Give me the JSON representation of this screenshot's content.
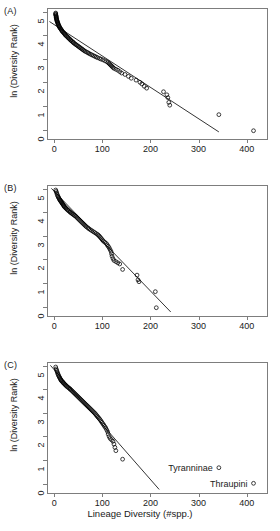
{
  "figure": {
    "xaxis_title": "Lineage Diversity (#spp.)",
    "yaxis_title": "ln (Diversity Rank)"
  },
  "panels": [
    {
      "tag": "(A)"
    },
    {
      "tag": "(B)"
    },
    {
      "tag": "(C)"
    }
  ],
  "axis": {
    "xticks": [
      "0",
      "100",
      "200",
      "300",
      "400"
    ],
    "yticks": [
      "0",
      "1",
      "2",
      "3",
      "4",
      "5"
    ]
  },
  "annotations": {
    "tyranninae": "Tyranninae",
    "thraupini": "Thraupini"
  },
  "colors": {
    "point": "#000000",
    "line": "#000000",
    "axis": "#7d7d7d",
    "background": "#ffffff"
  },
  "chart_data": {
    "type": "scatter",
    "title": "",
    "xlabel": "Lineage Diversity (#spp.)",
    "ylabel": "ln (Diversity Rank)",
    "xlim": [
      -15,
      440
    ],
    "ylim": [
      -0.35,
      5.15
    ],
    "grid": false,
    "legend": null,
    "panels": [
      {
        "tag": "(A)",
        "fit_line": {
          "x": [
            -12,
            340
          ],
          "y": [
            4.62,
            -0.05
          ]
        },
        "points": [
          {
            "x": 1,
            "y": 4.98
          },
          {
            "x": 1,
            "y": 4.95
          },
          {
            "x": 1,
            "y": 4.92
          },
          {
            "x": 1,
            "y": 4.89
          },
          {
            "x": 2,
            "y": 4.86
          },
          {
            "x": 2,
            "y": 4.83
          },
          {
            "x": 2,
            "y": 4.8
          },
          {
            "x": 2,
            "y": 4.77
          },
          {
            "x": 3,
            "y": 4.74
          },
          {
            "x": 3,
            "y": 4.71
          },
          {
            "x": 3,
            "y": 4.68
          },
          {
            "x": 4,
            "y": 4.65
          },
          {
            "x": 4,
            "y": 4.62
          },
          {
            "x": 5,
            "y": 4.59
          },
          {
            "x": 5,
            "y": 4.56
          },
          {
            "x": 6,
            "y": 4.53
          },
          {
            "x": 6,
            "y": 4.5
          },
          {
            "x": 7,
            "y": 4.47
          },
          {
            "x": 8,
            "y": 4.44
          },
          {
            "x": 8,
            "y": 4.41
          },
          {
            "x": 9,
            "y": 4.38
          },
          {
            "x": 10,
            "y": 4.35
          },
          {
            "x": 11,
            "y": 4.32
          },
          {
            "x": 12,
            "y": 4.29
          },
          {
            "x": 13,
            "y": 4.26
          },
          {
            "x": 14,
            "y": 4.23
          },
          {
            "x": 15,
            "y": 4.2
          },
          {
            "x": 16,
            "y": 4.17
          },
          {
            "x": 18,
            "y": 4.14
          },
          {
            "x": 19,
            "y": 4.11
          },
          {
            "x": 20,
            "y": 4.08
          },
          {
            "x": 21,
            "y": 4.05
          },
          {
            "x": 23,
            "y": 4.02
          },
          {
            "x": 24,
            "y": 3.99
          },
          {
            "x": 26,
            "y": 3.96
          },
          {
            "x": 27,
            "y": 3.93
          },
          {
            "x": 29,
            "y": 3.9
          },
          {
            "x": 30,
            "y": 3.87
          },
          {
            "x": 32,
            "y": 3.84
          },
          {
            "x": 33,
            "y": 3.81
          },
          {
            "x": 35,
            "y": 3.78
          },
          {
            "x": 37,
            "y": 3.75
          },
          {
            "x": 38,
            "y": 3.72
          },
          {
            "x": 40,
            "y": 3.69
          },
          {
            "x": 42,
            "y": 3.66
          },
          {
            "x": 44,
            "y": 3.63
          },
          {
            "x": 46,
            "y": 3.6
          },
          {
            "x": 48,
            "y": 3.57
          },
          {
            "x": 50,
            "y": 3.54
          },
          {
            "x": 52,
            "y": 3.51
          },
          {
            "x": 54,
            "y": 3.48
          },
          {
            "x": 56,
            "y": 3.45
          },
          {
            "x": 58,
            "y": 3.42
          },
          {
            "x": 60,
            "y": 3.39
          },
          {
            "x": 62,
            "y": 3.36
          },
          {
            "x": 65,
            "y": 3.33
          },
          {
            "x": 68,
            "y": 3.3
          },
          {
            "x": 70,
            "y": 3.27
          },
          {
            "x": 73,
            "y": 3.24
          },
          {
            "x": 76,
            "y": 3.21
          },
          {
            "x": 79,
            "y": 3.18
          },
          {
            "x": 82,
            "y": 3.15
          },
          {
            "x": 85,
            "y": 3.12
          },
          {
            "x": 88,
            "y": 3.09
          },
          {
            "x": 92,
            "y": 3.06
          },
          {
            "x": 95,
            "y": 3.03
          },
          {
            "x": 99,
            "y": 3.0
          },
          {
            "x": 103,
            "y": 2.96
          },
          {
            "x": 107,
            "y": 2.92
          },
          {
            "x": 110,
            "y": 2.88
          },
          {
            "x": 112,
            "y": 2.84
          },
          {
            "x": 114,
            "y": 2.8
          },
          {
            "x": 116,
            "y": 2.76
          },
          {
            "x": 118,
            "y": 2.72
          },
          {
            "x": 120,
            "y": 2.68
          },
          {
            "x": 122,
            "y": 2.64
          },
          {
            "x": 126,
            "y": 2.6
          },
          {
            "x": 130,
            "y": 2.56
          },
          {
            "x": 134,
            "y": 2.5
          },
          {
            "x": 138,
            "y": 2.44
          },
          {
            "x": 145,
            "y": 2.38
          },
          {
            "x": 152,
            "y": 2.3
          },
          {
            "x": 158,
            "y": 2.22
          },
          {
            "x": 168,
            "y": 2.14
          },
          {
            "x": 176,
            "y": 2.05
          },
          {
            "x": 180,
            "y": 1.98
          },
          {
            "x": 185,
            "y": 1.88
          },
          {
            "x": 190,
            "y": 1.8
          },
          {
            "x": 225,
            "y": 1.65
          },
          {
            "x": 232,
            "y": 1.52
          },
          {
            "x": 234,
            "y": 1.4
          },
          {
            "x": 236,
            "y": 1.2
          },
          {
            "x": 238,
            "y": 1.08
          },
          {
            "x": 340,
            "y": 0.68
          },
          {
            "x": 412,
            "y": 0.0
          }
        ]
      },
      {
        "tag": "(B)",
        "fit_line": {
          "x": [
            -8,
            240
          ],
          "y": [
            5.05,
            -0.18
          ]
        },
        "points": [
          {
            "x": 1,
            "y": 4.98
          },
          {
            "x": 2,
            "y": 4.92
          },
          {
            "x": 3,
            "y": 4.86
          },
          {
            "x": 4,
            "y": 4.8
          },
          {
            "x": 5,
            "y": 4.74
          },
          {
            "x": 6,
            "y": 4.7
          },
          {
            "x": 7,
            "y": 4.66
          },
          {
            "x": 8,
            "y": 4.62
          },
          {
            "x": 9,
            "y": 4.58
          },
          {
            "x": 10,
            "y": 4.55
          },
          {
            "x": 11,
            "y": 4.52
          },
          {
            "x": 12,
            "y": 4.49
          },
          {
            "x": 13,
            "y": 4.46
          },
          {
            "x": 14,
            "y": 4.43
          },
          {
            "x": 15,
            "y": 4.4
          },
          {
            "x": 16,
            "y": 4.37
          },
          {
            "x": 17,
            "y": 4.34
          },
          {
            "x": 18,
            "y": 4.31
          },
          {
            "x": 19,
            "y": 4.28
          },
          {
            "x": 20,
            "y": 4.25
          },
          {
            "x": 22,
            "y": 4.22
          },
          {
            "x": 23,
            "y": 4.19
          },
          {
            "x": 25,
            "y": 4.16
          },
          {
            "x": 26,
            "y": 4.13
          },
          {
            "x": 28,
            "y": 4.1
          },
          {
            "x": 30,
            "y": 4.07
          },
          {
            "x": 31,
            "y": 4.04
          },
          {
            "x": 33,
            "y": 4.01
          },
          {
            "x": 35,
            "y": 3.98
          },
          {
            "x": 37,
            "y": 3.95
          },
          {
            "x": 39,
            "y": 3.92
          },
          {
            "x": 41,
            "y": 3.89
          },
          {
            "x": 43,
            "y": 3.86
          },
          {
            "x": 45,
            "y": 3.82
          },
          {
            "x": 47,
            "y": 3.78
          },
          {
            "x": 49,
            "y": 3.74
          },
          {
            "x": 51,
            "y": 3.7
          },
          {
            "x": 53,
            "y": 3.66
          },
          {
            "x": 55,
            "y": 3.62
          },
          {
            "x": 57,
            "y": 3.58
          },
          {
            "x": 59,
            "y": 3.54
          },
          {
            "x": 61,
            "y": 3.5
          },
          {
            "x": 63,
            "y": 3.46
          },
          {
            "x": 65,
            "y": 3.42
          },
          {
            "x": 68,
            "y": 3.38
          },
          {
            "x": 70,
            "y": 3.34
          },
          {
            "x": 73,
            "y": 3.3
          },
          {
            "x": 76,
            "y": 3.26
          },
          {
            "x": 79,
            "y": 3.22
          },
          {
            "x": 82,
            "y": 3.18
          },
          {
            "x": 85,
            "y": 3.14
          },
          {
            "x": 88,
            "y": 3.1
          },
          {
            "x": 90,
            "y": 3.06
          },
          {
            "x": 92,
            "y": 3.02
          },
          {
            "x": 94,
            "y": 2.97
          },
          {
            "x": 96,
            "y": 2.92
          },
          {
            "x": 98,
            "y": 2.87
          },
          {
            "x": 100,
            "y": 2.82
          },
          {
            "x": 103,
            "y": 2.77
          },
          {
            "x": 106,
            "y": 2.72
          },
          {
            "x": 108,
            "y": 2.66
          },
          {
            "x": 110,
            "y": 2.6
          },
          {
            "x": 112,
            "y": 2.54
          },
          {
            "x": 114,
            "y": 2.46
          },
          {
            "x": 116,
            "y": 2.38
          },
          {
            "x": 117,
            "y": 2.28
          },
          {
            "x": 118,
            "y": 2.18
          },
          {
            "x": 120,
            "y": 2.08
          },
          {
            "x": 122,
            "y": 2.0
          },
          {
            "x": 126,
            "y": 1.95
          },
          {
            "x": 130,
            "y": 1.9
          },
          {
            "x": 134,
            "y": 1.85
          },
          {
            "x": 140,
            "y": 1.62
          },
          {
            "x": 170,
            "y": 1.38
          },
          {
            "x": 172,
            "y": 1.18
          },
          {
            "x": 174,
            "y": 1.1
          },
          {
            "x": 208,
            "y": 0.68
          },
          {
            "x": 210,
            "y": 0.0
          }
        ]
      },
      {
        "tag": "(C)",
        "fit_line": {
          "x": [
            -10,
            216
          ],
          "y": [
            5.05,
            -0.2
          ]
        },
        "points": [
          {
            "x": 1,
            "y": 4.98
          },
          {
            "x": 2,
            "y": 4.9
          },
          {
            "x": 3,
            "y": 4.84
          },
          {
            "x": 4,
            "y": 4.78
          },
          {
            "x": 5,
            "y": 4.72
          },
          {
            "x": 6,
            "y": 4.67
          },
          {
            "x": 7,
            "y": 4.62
          },
          {
            "x": 8,
            "y": 4.58
          },
          {
            "x": 9,
            "y": 4.54
          },
          {
            "x": 10,
            "y": 4.5
          },
          {
            "x": 11,
            "y": 4.46
          },
          {
            "x": 12,
            "y": 4.43
          },
          {
            "x": 13,
            "y": 4.4
          },
          {
            "x": 14,
            "y": 4.37
          },
          {
            "x": 16,
            "y": 4.34
          },
          {
            "x": 17,
            "y": 4.31
          },
          {
            "x": 18,
            "y": 4.28
          },
          {
            "x": 20,
            "y": 4.25
          },
          {
            "x": 21,
            "y": 4.22
          },
          {
            "x": 23,
            "y": 4.19
          },
          {
            "x": 24,
            "y": 4.16
          },
          {
            "x": 26,
            "y": 4.13
          },
          {
            "x": 28,
            "y": 4.1
          },
          {
            "x": 30,
            "y": 4.07
          },
          {
            "x": 31,
            "y": 4.04
          },
          {
            "x": 33,
            "y": 4.01
          },
          {
            "x": 35,
            "y": 3.97
          },
          {
            "x": 37,
            "y": 3.93
          },
          {
            "x": 39,
            "y": 3.89
          },
          {
            "x": 41,
            "y": 3.85
          },
          {
            "x": 43,
            "y": 3.81
          },
          {
            "x": 45,
            "y": 3.77
          },
          {
            "x": 47,
            "y": 3.73
          },
          {
            "x": 49,
            "y": 3.69
          },
          {
            "x": 51,
            "y": 3.65
          },
          {
            "x": 53,
            "y": 3.61
          },
          {
            "x": 55,
            "y": 3.57
          },
          {
            "x": 57,
            "y": 3.53
          },
          {
            "x": 59,
            "y": 3.49
          },
          {
            "x": 61,
            "y": 3.45
          },
          {
            "x": 63,
            "y": 3.41
          },
          {
            "x": 65,
            "y": 3.37
          },
          {
            "x": 67,
            "y": 3.33
          },
          {
            "x": 69,
            "y": 3.29
          },
          {
            "x": 71,
            "y": 3.25
          },
          {
            "x": 73,
            "y": 3.21
          },
          {
            "x": 75,
            "y": 3.17
          },
          {
            "x": 77,
            "y": 3.13
          },
          {
            "x": 79,
            "y": 3.09
          },
          {
            "x": 81,
            "y": 3.05
          },
          {
            "x": 83,
            "y": 3.01
          },
          {
            "x": 85,
            "y": 2.96
          },
          {
            "x": 87,
            "y": 2.91
          },
          {
            "x": 89,
            "y": 2.86
          },
          {
            "x": 91,
            "y": 2.81
          },
          {
            "x": 93,
            "y": 2.76
          },
          {
            "x": 95,
            "y": 2.7
          },
          {
            "x": 97,
            "y": 2.64
          },
          {
            "x": 99,
            "y": 2.58
          },
          {
            "x": 101,
            "y": 2.52
          },
          {
            "x": 103,
            "y": 2.46
          },
          {
            "x": 105,
            "y": 2.4
          },
          {
            "x": 107,
            "y": 2.32
          },
          {
            "x": 109,
            "y": 2.24
          },
          {
            "x": 110,
            "y": 2.14
          },
          {
            "x": 112,
            "y": 2.04
          },
          {
            "x": 114,
            "y": 1.96
          },
          {
            "x": 117,
            "y": 1.9
          },
          {
            "x": 120,
            "y": 1.84
          },
          {
            "x": 122,
            "y": 1.72
          },
          {
            "x": 124,
            "y": 1.58
          },
          {
            "x": 126,
            "y": 1.44
          },
          {
            "x": 140,
            "y": 1.08
          },
          {
            "x": 340,
            "y": 0.72
          },
          {
            "x": 412,
            "y": 0.06
          }
        ],
        "annotations": [
          {
            "text": "Tyranninae",
            "x": 340,
            "y": 0.72
          },
          {
            "text": "Thraupini",
            "x": 412,
            "y": 0.06
          }
        ]
      }
    ]
  }
}
